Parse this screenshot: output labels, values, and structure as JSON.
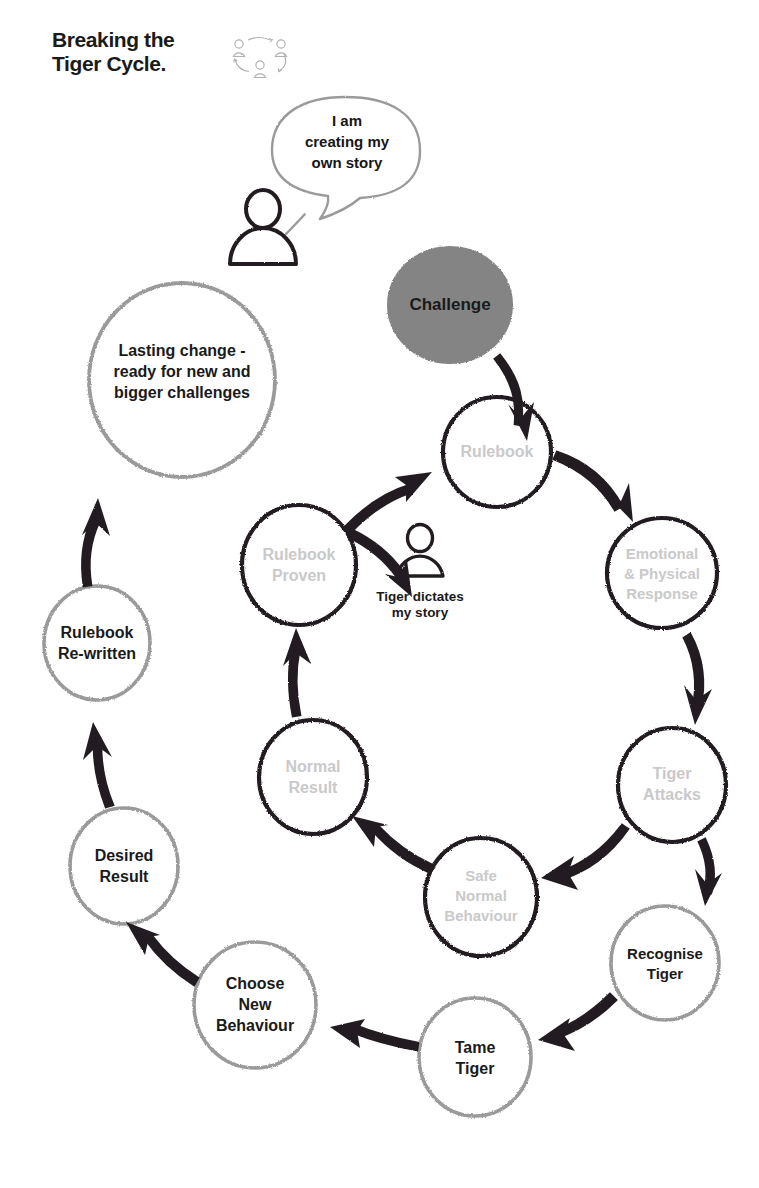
{
  "page": {
    "title_line1": "Breaking the",
    "title_line2": "Tiger Cycle.",
    "title": "Breaking the\nTiger Cycle.",
    "background_color": "#ffffff"
  },
  "logo": {
    "name": "three-people-cycle-logo",
    "figure_count": 3,
    "color": "#b4b4b4"
  },
  "colors": {
    "dark_ink": "#231f20",
    "mid_grey": "#8c8c8c",
    "light_grey_text": "#c9c9c9",
    "challenge_fill": "#848484",
    "text_dark": "#1a1a1a"
  },
  "speech_bubble": {
    "name": "i-am-creating-my-own-story-bubble",
    "lines": [
      "I am",
      "creating my",
      "own story"
    ],
    "text": "I am creating my own story",
    "outline_color": "#9a9a9a"
  },
  "figures": [
    {
      "name": "person-empowered",
      "caption": "",
      "caption_lines": []
    },
    {
      "name": "person-tiger-dictates",
      "caption": "Tiger dictates my story",
      "caption_lines": [
        "Tiger dictates",
        "my story"
      ]
    }
  ],
  "nodes": [
    {
      "id": "challenge",
      "label": "Challenge",
      "lines": [
        "Challenge"
      ],
      "style": "filled",
      "fill": "#848484",
      "stroke": "#848484",
      "text_color": "#1a1a1a",
      "cx": 450,
      "cy": 305,
      "rx": 62,
      "ry": 58,
      "font_size": 17
    },
    {
      "id": "rulebook",
      "label": "Rulebook",
      "lines": [
        "Rulebook"
      ],
      "style": "outline",
      "fill": "none",
      "stroke": "#231f20",
      "text_color": "#c9c9c9",
      "cx": 497,
      "cy": 452,
      "rx": 54,
      "ry": 55,
      "font_size": 16
    },
    {
      "id": "emotional-physical-response",
      "label": "Emotional & Physical Response",
      "lines": [
        "Emotional",
        "& Physical",
        "Response"
      ],
      "style": "outline",
      "fill": "none",
      "stroke": "#231f20",
      "text_color": "#c9c9c9",
      "cx": 662,
      "cy": 573,
      "rx": 55,
      "ry": 55,
      "font_size": 15
    },
    {
      "id": "tiger-attacks",
      "label": "Tiger Attacks",
      "lines": [
        "Tiger",
        "Attacks"
      ],
      "style": "outline",
      "fill": "none",
      "stroke": "#231f20",
      "text_color": "#c9c9c9",
      "cx": 672,
      "cy": 785,
      "rx": 54,
      "ry": 57,
      "font_size": 16
    },
    {
      "id": "recognise-tiger",
      "label": "Recognise Tiger",
      "lines": [
        "Recognise",
        "Tiger"
      ],
      "style": "outline",
      "fill": "none",
      "stroke": "#9a9a9a",
      "text_color": "#1a1a1a",
      "cx": 665,
      "cy": 963,
      "rx": 54,
      "ry": 57,
      "font_size": 15
    },
    {
      "id": "tame-tiger",
      "label": "Tame Tiger",
      "lines": [
        "Tame",
        "Tiger"
      ],
      "style": "outline",
      "fill": "none",
      "stroke": "#9a9a9a",
      "text_color": "#1a1a1a",
      "cx": 475,
      "cy": 1057,
      "rx": 56,
      "ry": 59,
      "font_size": 16
    },
    {
      "id": "choose-new-behaviour",
      "label": "Choose New Behaviour",
      "lines": [
        "Choose",
        "New",
        "Behaviour"
      ],
      "style": "outline",
      "fill": "none",
      "stroke": "#9a9a9a",
      "text_color": "#1a1a1a",
      "cx": 255,
      "cy": 1005,
      "rx": 61,
      "ry": 63,
      "font_size": 16
    },
    {
      "id": "desired-result",
      "label": "Desired Result",
      "lines": [
        "Desired",
        "Result"
      ],
      "style": "outline",
      "fill": "none",
      "stroke": "#9a9a9a",
      "text_color": "#1a1a1a",
      "cx": 124,
      "cy": 866,
      "rx": 54,
      "ry": 58,
      "font_size": 16
    },
    {
      "id": "rulebook-re-written",
      "label": "Rulebook Re-written",
      "lines": [
        "Rulebook",
        "Re-written"
      ],
      "style": "outline",
      "fill": "none",
      "stroke": "#9a9a9a",
      "text_color": "#1a1a1a",
      "cx": 97,
      "cy": 643,
      "rx": 53,
      "ry": 57,
      "font_size": 16
    },
    {
      "id": "lasting-change",
      "label": "Lasting change - ready for new and bigger challenges",
      "lines": [
        "Lasting change -",
        "ready for new and",
        "bigger challenges"
      ],
      "style": "outline",
      "fill": "none",
      "stroke": "#9a9a9a",
      "text_color": "#1a1a1a",
      "cx": 182,
      "cy": 380,
      "rx": 93,
      "ry": 97,
      "font_size": 16
    },
    {
      "id": "safe-normal-behaviour",
      "label": "Safe Normal Behaviour",
      "lines": [
        "Safe",
        "Normal",
        "Behaviour"
      ],
      "style": "outline",
      "fill": "none",
      "stroke": "#231f20",
      "text_color": "#c9c9c9",
      "cx": 481,
      "cy": 897,
      "rx": 56,
      "ry": 59,
      "font_size": 15
    },
    {
      "id": "normal-result",
      "label": "Normal Result",
      "lines": [
        "Normal",
        "Result"
      ],
      "style": "outline",
      "fill": "none",
      "stroke": "#231f20",
      "text_color": "#c9c9c9",
      "cx": 313,
      "cy": 777,
      "rx": 54,
      "ry": 57,
      "font_size": 16
    },
    {
      "id": "rulebook-proven",
      "label": "Rulebook Proven",
      "lines": [
        "Rulebook",
        "Proven"
      ],
      "style": "outline",
      "fill": "none",
      "stroke": "#231f20",
      "text_color": "#c9c9c9",
      "cx": 299,
      "cy": 565,
      "rx": 57,
      "ry": 60,
      "font_size": 16
    }
  ],
  "arrows": [
    {
      "name": "arrow-challenge-to-rulebook",
      "from": "challenge",
      "to": "rulebook",
      "color": "#231f20"
    },
    {
      "name": "arrow-rulebook-to-emotional",
      "from": "rulebook",
      "to": "emotional-physical-response",
      "color": "#231f20"
    },
    {
      "name": "arrow-emotional-to-tiger-attacks",
      "from": "emotional-physical-response",
      "to": "tiger-attacks",
      "color": "#231f20"
    },
    {
      "name": "arrow-tiger-attacks-to-recognise",
      "from": "tiger-attacks",
      "to": "recognise-tiger",
      "color": "#231f20"
    },
    {
      "name": "arrow-tiger-attacks-to-safe-normal",
      "from": "tiger-attacks",
      "to": "safe-normal-behaviour",
      "color": "#231f20"
    },
    {
      "name": "arrow-safe-normal-to-normal-result",
      "from": "safe-normal-behaviour",
      "to": "normal-result",
      "color": "#231f20"
    },
    {
      "name": "arrow-normal-result-to-rulebook-proven",
      "from": "normal-result",
      "to": "rulebook-proven",
      "color": "#231f20"
    },
    {
      "name": "arrow-rulebook-proven-to-rulebook",
      "from": "rulebook-proven",
      "to": "rulebook",
      "color": "#231f20"
    },
    {
      "name": "arrow-rulebook-to-tiger-figure",
      "from": "rulebook",
      "to": "person-tiger-dictates",
      "color": "#231f20"
    },
    {
      "name": "arrow-recognise-to-tame-tiger",
      "from": "recognise-tiger",
      "to": "tame-tiger",
      "color": "#231f20"
    },
    {
      "name": "arrow-tame-tiger-to-choose-new",
      "from": "tame-tiger",
      "to": "choose-new-behaviour",
      "color": "#231f20"
    },
    {
      "name": "arrow-choose-new-to-desired-result",
      "from": "choose-new-behaviour",
      "to": "desired-result",
      "color": "#231f20"
    },
    {
      "name": "arrow-desired-result-to-rulebook-rewritten",
      "from": "desired-result",
      "to": "rulebook-re-written",
      "color": "#231f20"
    },
    {
      "name": "arrow-rulebook-rewritten-to-lasting-change",
      "from": "rulebook-re-written",
      "to": "lasting-change",
      "color": "#231f20"
    }
  ]
}
